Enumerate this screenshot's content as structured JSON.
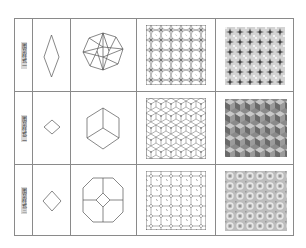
{
  "figure": {
    "columns": [
      "label",
      "unit-shape",
      "motif",
      "line-tiling",
      "shaded-tiling"
    ],
    "rows": [
      {
        "label": "图案样式一",
        "unit": "rhombus-tall",
        "motif": "octagon-star-rhombi",
        "tiling": "star-rhombus-lattice",
        "shaded": "shaded-star-lattice"
      },
      {
        "label": "图案样式二",
        "unit": "rhombus-wide",
        "motif": "hexagon-cube",
        "tiling": "cube-lattice",
        "shaded": "shaded-cube-lattice"
      },
      {
        "label": "图案样式三",
        "unit": "square-diamond",
        "motif": "octagon-cross-diamond",
        "tiling": "octagon-square-lattice",
        "shaded": "shaded-octagon-lattice"
      }
    ],
    "colors": {
      "grid": "#8a8a8a",
      "stroke": "#555555",
      "shade_dark": "#6b6b6b",
      "shade_light": "#c8c8c8"
    }
  }
}
